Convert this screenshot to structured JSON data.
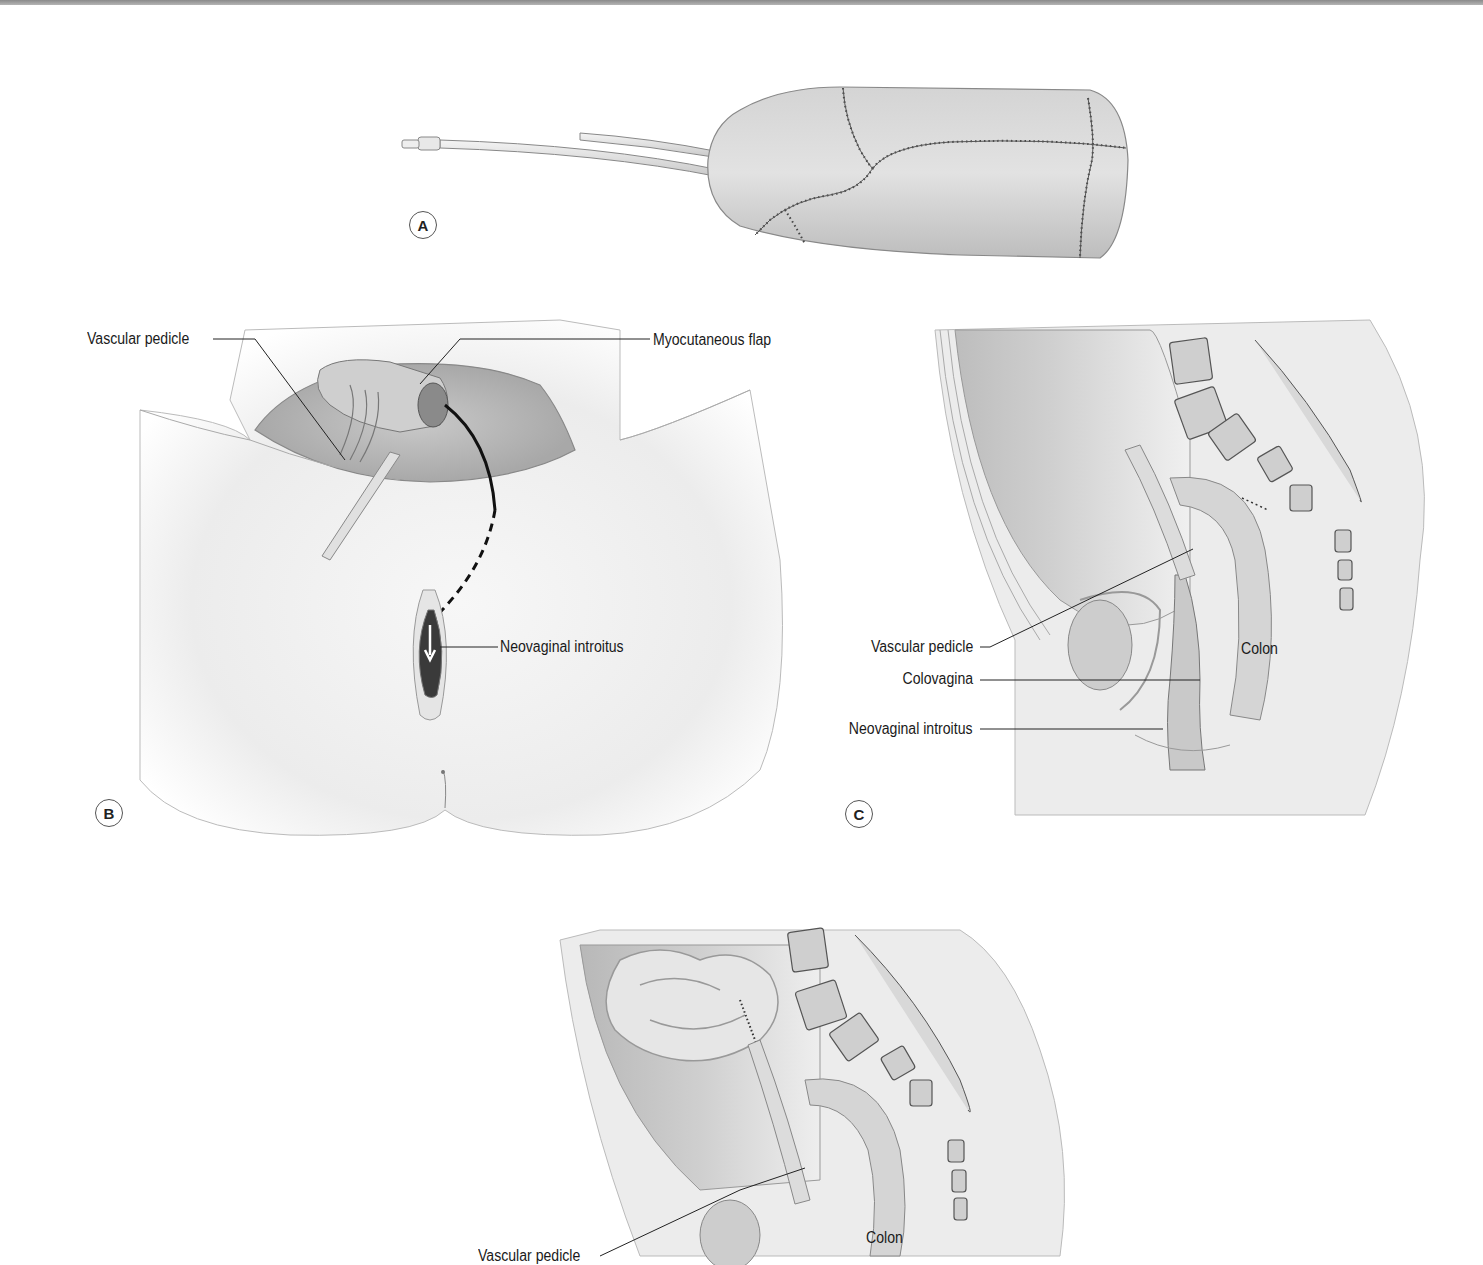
{
  "figure": {
    "panels": [
      {
        "id": "A",
        "badge": "A",
        "description": "Sutured myocutaneous tube flap over stent with drainage tubes",
        "labels": []
      },
      {
        "id": "B",
        "badge": "B",
        "description": "Perineal view: flap tunneled to neovaginal introitus",
        "labels": [
          {
            "key": "vascular_pedicle",
            "text": "Vascular pedicle"
          },
          {
            "key": "myocutaneous_flap",
            "text": "Myocutaneous flap"
          },
          {
            "key": "neovaginal_introitus",
            "text": "Neovaginal introitus"
          }
        ]
      },
      {
        "id": "C",
        "badge": "C",
        "description": "Sagittal pelvis: colovagina",
        "labels": [
          {
            "key": "vascular_pedicle",
            "text": "Vascular pedicle"
          },
          {
            "key": "colovagina",
            "text": "Colovagina"
          },
          {
            "key": "neovaginal_introitus",
            "text": "Neovaginal introitus"
          },
          {
            "key": "colon",
            "text": "Colon"
          }
        ]
      },
      {
        "id": "D",
        "badge": "",
        "description": "Sagittal pelvis: small bowel vaginoplasty (partially visible)",
        "labels": [
          {
            "key": "vascular_pedicle",
            "text": "Vascular pedicle"
          },
          {
            "key": "colon",
            "text": "Colon"
          }
        ]
      }
    ],
    "colors": {
      "background": "#ffffff",
      "tissue": "#d9d9d9",
      "tissue_dark": "#9a9a9a",
      "line": "#1a1a1a",
      "suture": "#3a3a3a",
      "bone": "#c8c8c8"
    }
  }
}
